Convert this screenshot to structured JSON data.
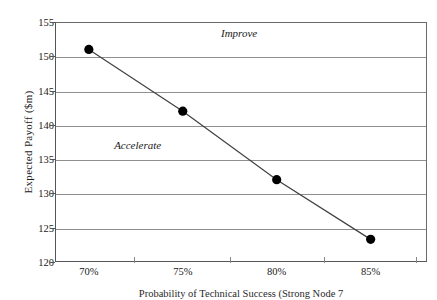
{
  "chart_data": {
    "type": "line",
    "title": "",
    "xlabel": "Probability of Technical Success (Strong Node 7",
    "ylabel": "Expected Payoff  ($m)",
    "categories": [
      "70%",
      "75%",
      "80%",
      "85%"
    ],
    "x": [
      70,
      75,
      80,
      85
    ],
    "values": [
      151,
      142,
      132,
      123.3
    ],
    "series": [
      {
        "name": "Expected Payoff",
        "values": [
          151,
          142,
          132,
          123.3
        ]
      }
    ],
    "ylim": [
      120,
      155
    ],
    "xlim": [
      68.2,
      88.0
    ],
    "y_ticks": [
      120,
      125,
      130,
      135,
      140,
      145,
      150,
      155
    ],
    "y_tick_labels": [
      "120",
      "125",
      "130",
      "135",
      "140",
      "145",
      "150",
      "155"
    ],
    "x_ticks": [
      70,
      75,
      80,
      85
    ],
    "x_tick_labels": [
      "70%",
      "75%",
      "80%",
      "85%"
    ],
    "grid": "horizontal",
    "legend": "none",
    "annotations": [
      {
        "text": "Improve",
        "x": 78.0,
        "y": 153.4
      },
      {
        "text": "Accelerate",
        "x": 72.6,
        "y": 137.0
      }
    ],
    "colors": {
      "line": "#404040",
      "marker": "#000000",
      "gridline": "#8f8f8f",
      "axis": "#555555",
      "background": "#ffffff"
    }
  }
}
